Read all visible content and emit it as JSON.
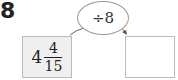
{
  "problem": {
    "number": "8",
    "operation": "÷8",
    "input": {
      "whole": "4",
      "numerator": "4",
      "denominator": "15"
    },
    "output": ""
  },
  "colors": {
    "input_box_fill": "#efefef",
    "border": "#bbbbbb",
    "arrow": "#666666"
  }
}
